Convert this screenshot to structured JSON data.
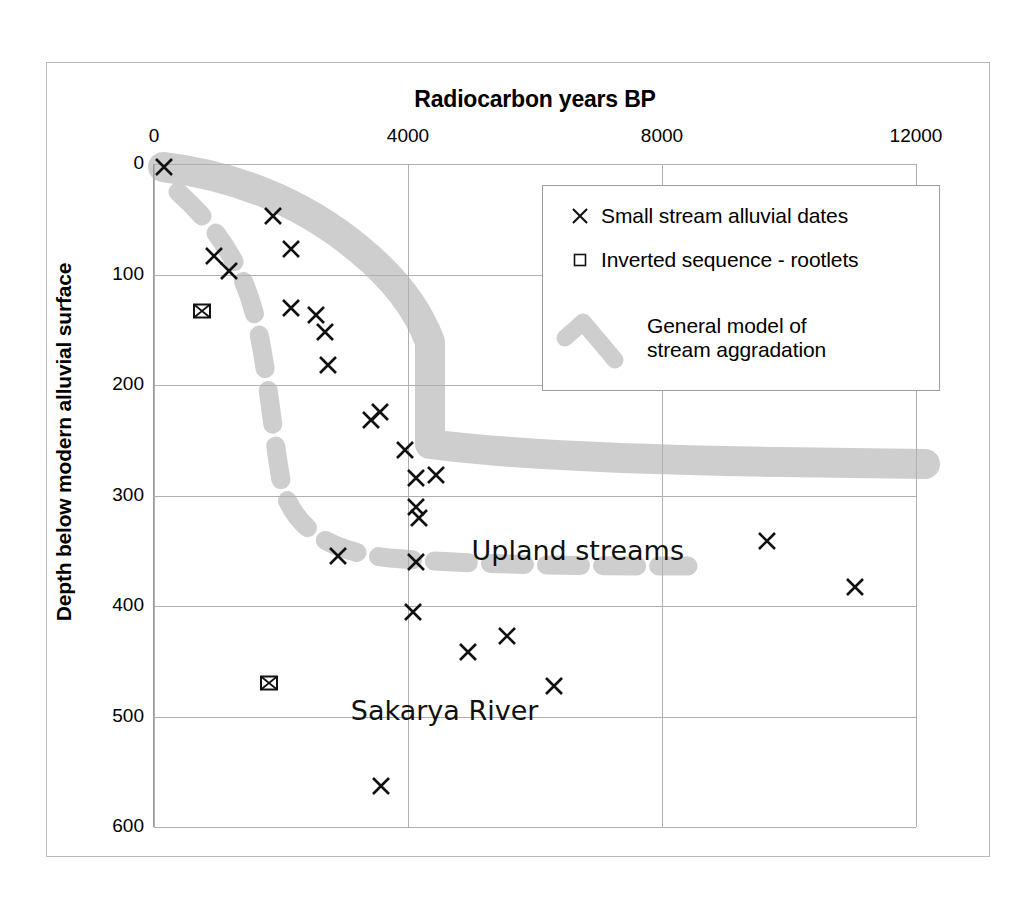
{
  "chart_data": {
    "type": "scatter",
    "title": "Radiocarbon years BP",
    "xlabel": "Radiocarbon years BP",
    "ylabel": "Depth below modern alluvial surface",
    "xlim": [
      0,
      12000
    ],
    "ylim": [
      600,
      0
    ],
    "y_inverted": true,
    "grid": true,
    "x_ticks": [
      0,
      4000,
      8000,
      12000
    ],
    "x_tick_labels": [
      "0",
      "4000",
      "8000",
      "12000"
    ],
    "y_ticks": [
      0,
      100,
      200,
      300,
      400,
      500,
      600
    ],
    "y_tick_labels": [
      "0",
      "100",
      "200",
      "300",
      "400",
      "500",
      "600"
    ],
    "legend_position": "upper right",
    "series": [
      {
        "name": "Small stream alluvial dates",
        "marker": "x",
        "color": "#111111",
        "points": [
          [
            150,
            3
          ],
          [
            950,
            83
          ],
          [
            1180,
            97
          ],
          [
            1870,
            47
          ],
          [
            2160,
            77
          ],
          [
            2160,
            130
          ],
          [
            2550,
            137
          ],
          [
            2700,
            152
          ],
          [
            2740,
            182
          ],
          [
            3420,
            232
          ],
          [
            3560,
            224
          ],
          [
            3960,
            259
          ],
          [
            4130,
            284
          ],
          [
            4130,
            310
          ],
          [
            4440,
            281
          ],
          [
            4180,
            320
          ],
          [
            2900,
            355
          ],
          [
            4130,
            360
          ],
          [
            4080,
            405
          ],
          [
            4950,
            442
          ],
          [
            5560,
            427
          ],
          [
            6300,
            472
          ],
          [
            3580,
            563
          ],
          [
            9660,
            341
          ],
          [
            11040,
            383
          ]
        ]
      },
      {
        "name": "Inverted sequence - rootlets",
        "marker": "boxed-x",
        "color": "#111111",
        "points": [
          [
            760,
            133
          ],
          [
            1810,
            470
          ]
        ]
      }
    ],
    "bands": [
      {
        "name": "General model of stream aggradation - upland streams",
        "style": "solid-thick-gray",
        "color": "#cecece",
        "path": [
          [
            150,
            0
          ],
          [
            1500,
            55
          ],
          [
            2700,
            130
          ],
          [
            3700,
            210
          ],
          [
            4150,
            250
          ],
          [
            4150,
            410
          ],
          [
            6000,
            425
          ],
          [
            9000,
            432
          ],
          [
            12000,
            432
          ]
        ]
      },
      {
        "name": "General model of stream aggradation - Sakarya River",
        "style": "dashed-thick-gray",
        "color": "#cecece",
        "path": [
          [
            400,
            25
          ],
          [
            900,
            95
          ],
          [
            1280,
            185
          ],
          [
            1480,
            290
          ],
          [
            1700,
            400
          ],
          [
            2100,
            480
          ],
          [
            2800,
            525
          ],
          [
            4000,
            538
          ],
          [
            8400,
            540
          ]
        ]
      }
    ],
    "annotations": [
      {
        "text": "Upland streams",
        "x": 5000,
        "y": 352
      },
      {
        "text": "Sakarya River",
        "x": 3100,
        "y": 497
      }
    ]
  },
  "chart": {
    "title": "Radiocarbon years BP",
    "y_axis_title": "Depth below modern alluvial surface",
    "x_ticks": [
      "0",
      "4000",
      "8000",
      "12000"
    ],
    "y_ticks": [
      "0",
      "100",
      "200",
      "300",
      "400",
      "500",
      "600"
    ],
    "annotation_upland": "Upland streams",
    "annotation_sakarya": "Sakarya River"
  },
  "legend": {
    "items": [
      {
        "label": "Small stream alluvial dates",
        "marker": "x-marker"
      },
      {
        "label": "Inverted sequence - rootlets",
        "marker": "square-marker"
      },
      {
        "label_line1": "General model of",
        "label_line2": "stream aggradation",
        "marker": "gray-band-swatch"
      }
    ]
  },
  "colors": {
    "band": "#cecece",
    "marker": "#111111",
    "grid": "#b0b0b0",
    "frame": "#b9b9b9",
    "background": "#ffffff"
  }
}
